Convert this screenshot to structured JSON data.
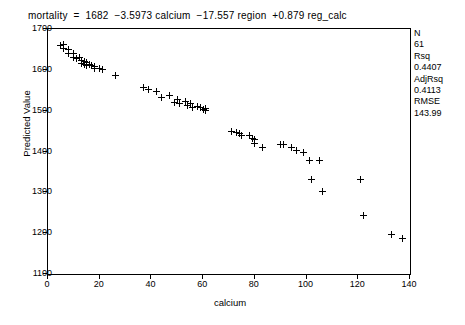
{
  "equation": "mortality  =  1682  −3.5973 calcium  −17.557 region  +0.879 reg_calc",
  "axes": {
    "xlabel": "calcium",
    "ylabel": "Predicted Value",
    "xticks": [
      "0",
      "20",
      "40",
      "60",
      "80",
      "100",
      "120",
      "140"
    ],
    "yticks": [
      "1100",
      "1200",
      "1300",
      "1400",
      "1500",
      "1600",
      "1700"
    ]
  },
  "stats": {
    "n_label": "N",
    "n_value": "61",
    "rsq_label": "Rsq",
    "rsq_value": "0.4407",
    "adjrsq_label": "AdjRsq",
    "adjrsq_value": "0.4113",
    "rmse_label": "RMSE",
    "rmse_value": "143.99"
  },
  "chart_data": {
    "type": "scatter",
    "title": "",
    "xlabel": "calcium",
    "ylabel": "Predicted Value",
    "xlim": [
      0,
      140
    ],
    "ylim": [
      1100,
      1700
    ],
    "grid": false,
    "legend": null,
    "marker": "plus",
    "annotations": [
      "mortality  =  1682  −3.5973 calcium  −17.557 region  +0.879 reg_calc",
      "N 61",
      "Rsq 0.4407",
      "AdjRsq 0.4113",
      "RMSE 143.99"
    ],
    "series": [
      {
        "name": "Predicted Value",
        "x": [
          5,
          6,
          6,
          8,
          8,
          10,
          10,
          11,
          12,
          13,
          13,
          14,
          14,
          15,
          15,
          16,
          17,
          18,
          18,
          20,
          21,
          26,
          37,
          39,
          42,
          44,
          47,
          49,
          50,
          51,
          53,
          54,
          55,
          56,
          58,
          59,
          60,
          61,
          61,
          71,
          73,
          74,
          75,
          78,
          79,
          80,
          80,
          83,
          90,
          91,
          94,
          96,
          99,
          101,
          102,
          105,
          106,
          121,
          122,
          133,
          137
        ],
        "y": [
          1660,
          1662,
          1652,
          1650,
          1640,
          1640,
          1630,
          1628,
          1630,
          1622,
          1616,
          1620,
          1612,
          1618,
          1610,
          1612,
          1610,
          1608,
          1604,
          1604,
          1600,
          1586,
          1556,
          1552,
          1548,
          1532,
          1538,
          1520,
          1528,
          1518,
          1522,
          1512,
          1518,
          1508,
          1510,
          1508,
          1504,
          1506,
          1500,
          1450,
          1446,
          1444,
          1438,
          1440,
          1432,
          1430,
          1420,
          1410,
          1418,
          1418,
          1410,
          1402,
          1398,
          1378,
          1332,
          1378,
          1302,
          1332,
          1244,
          1196,
          1188
        ]
      }
    ]
  }
}
